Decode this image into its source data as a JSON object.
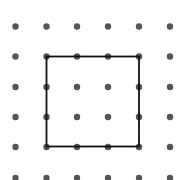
{
  "diagram": {
    "type": "dot-grid-with-square",
    "grid": {
      "columns_x": [
        15.5,
        46.5,
        77,
        108,
        139,
        170
      ],
      "rows_y": [
        26.5,
        56.5,
        87,
        117,
        147,
        178
      ],
      "dot_radius": 3.2,
      "dot_color": "#555555"
    },
    "square": {
      "x1": 46.5,
      "y1": 56.5,
      "x2": 139,
      "y2": 146.5,
      "stroke_color": "#111111",
      "stroke_width": 1.8,
      "side_units": 3
    }
  }
}
